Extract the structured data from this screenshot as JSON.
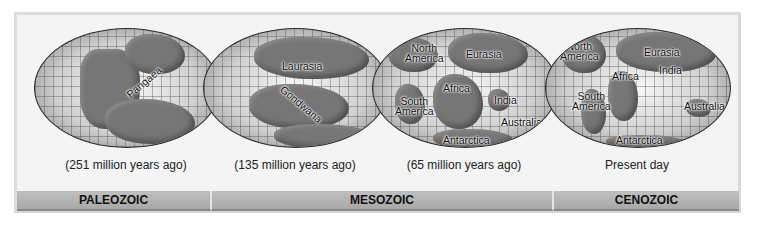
{
  "figure": {
    "panels": [
      {
        "id": "paleozoic-globe",
        "caption": "(251 million years ago)",
        "labels": [
          {
            "text": "Pangaea",
            "rotate": -40
          }
        ]
      },
      {
        "id": "mesozoic-early-globe",
        "caption": "(135 million years ago)",
        "labels": [
          {
            "text": "Laurasia",
            "rotate": 0
          },
          {
            "text": "Gondwana",
            "rotate": 40
          }
        ]
      },
      {
        "id": "mesozoic-late-globe",
        "caption": "(65 million years ago)",
        "labels": [
          {
            "text": "North\nAmerica"
          },
          {
            "text": "Eurasia"
          },
          {
            "text": "Africa"
          },
          {
            "text": "South\nAmerica"
          },
          {
            "text": "India"
          },
          {
            "text": "Australia"
          },
          {
            "text": "Antarctica"
          }
        ]
      },
      {
        "id": "present-globe",
        "caption": "Present day",
        "labels": [
          {
            "text": "North\nAmerica"
          },
          {
            "text": "Eurasia"
          },
          {
            "text": "Africa"
          },
          {
            "text": "India"
          },
          {
            "text": "South\nAmerica"
          },
          {
            "text": "Australia"
          },
          {
            "text": "Antarctica"
          }
        ]
      }
    ],
    "eras": [
      {
        "label": "PALEOZOIC",
        "width": 195
      },
      {
        "label": "MESOZOIC",
        "width": 342
      },
      {
        "label": "CENOZOIC",
        "width": 185
      }
    ]
  }
}
